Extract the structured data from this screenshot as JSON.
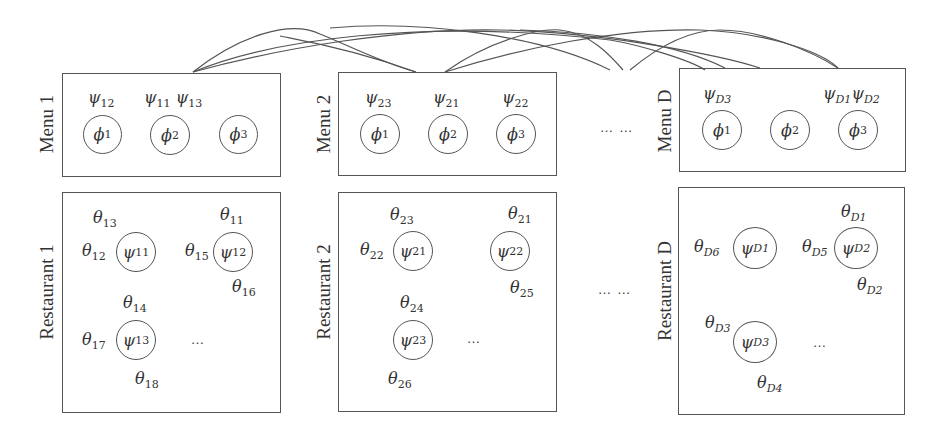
{
  "diagram": {
    "type": "menu-restaurant hierarchical model",
    "stroke_color": "#555555",
    "ellipsis": "… …",
    "inner_ellipsis": "…",
    "menus": [
      {
        "label": "Menu 1",
        "nodes": [
          {
            "sym": "ϕ",
            "sub": "1",
            "assigned": [
              {
                "sym": "ψ",
                "sub": "12"
              }
            ]
          },
          {
            "sym": "ϕ",
            "sub": "2",
            "assigned": [
              {
                "sym": "ψ",
                "sub": "11"
              },
              {
                "sym": "ψ",
                "sub": "13"
              }
            ]
          },
          {
            "sym": "ϕ",
            "sub": "3",
            "assigned": []
          }
        ]
      },
      {
        "label": "Menu 2",
        "nodes": [
          {
            "sym": "ϕ",
            "sub": "1",
            "assigned": [
              {
                "sym": "ψ",
                "sub": "23"
              }
            ]
          },
          {
            "sym": "ϕ",
            "sub": "2",
            "assigned": [
              {
                "sym": "ψ",
                "sub": "21"
              }
            ]
          },
          {
            "sym": "ϕ",
            "sub": "3",
            "assigned": [
              {
                "sym": "ψ",
                "sub": "22"
              }
            ]
          }
        ]
      },
      {
        "label": "Menu D",
        "nodes": [
          {
            "sym": "ϕ",
            "sub": "1",
            "assigned": [
              {
                "sym": "ψ",
                "sub": "D3"
              }
            ]
          },
          {
            "sym": "ϕ",
            "sub": "2",
            "assigned": []
          },
          {
            "sym": "ϕ",
            "sub": "3",
            "assigned": [
              {
                "sym": "ψ",
                "sub": "D1"
              },
              {
                "sym": "ψ",
                "sub": "D2"
              }
            ]
          }
        ]
      }
    ],
    "restaurants": [
      {
        "label": "Restaurant 1",
        "tables": [
          {
            "sym": "ψ",
            "sub": "11",
            "customers": [
              {
                "sym": "θ",
                "sub": "13"
              },
              {
                "sym": "θ",
                "sub": "12"
              }
            ]
          },
          {
            "sym": "ψ",
            "sub": "12",
            "customers": [
              {
                "sym": "θ",
                "sub": "11"
              },
              {
                "sym": "θ",
                "sub": "15"
              },
              {
                "sym": "θ",
                "sub": "16"
              }
            ]
          },
          {
            "sym": "ψ",
            "sub": "13",
            "customers": [
              {
                "sym": "θ",
                "sub": "14"
              },
              {
                "sym": "θ",
                "sub": "17"
              },
              {
                "sym": "θ",
                "sub": "18"
              }
            ]
          }
        ]
      },
      {
        "label": "Restaurant 2",
        "tables": [
          {
            "sym": "ψ",
            "sub": "21",
            "customers": [
              {
                "sym": "θ",
                "sub": "23"
              },
              {
                "sym": "θ",
                "sub": "22"
              }
            ]
          },
          {
            "sym": "ψ",
            "sub": "22",
            "customers": [
              {
                "sym": "θ",
                "sub": "21"
              },
              {
                "sym": "θ",
                "sub": "25"
              }
            ]
          },
          {
            "sym": "ψ",
            "sub": "23",
            "customers": [
              {
                "sym": "θ",
                "sub": "24"
              },
              {
                "sym": "θ",
                "sub": "26"
              }
            ]
          }
        ]
      },
      {
        "label": "Restaurant D",
        "tables": [
          {
            "sym": "ψ",
            "sub": "D1",
            "customers": [
              {
                "sym": "θ",
                "sub": "D6"
              }
            ]
          },
          {
            "sym": "ψ",
            "sub": "D2",
            "customers": [
              {
                "sym": "θ",
                "sub": "D1"
              },
              {
                "sym": "θ",
                "sub": "D5"
              },
              {
                "sym": "θ",
                "sub": "D2"
              }
            ]
          },
          {
            "sym": "ψ",
            "sub": "D3",
            "customers": [
              {
                "sym": "θ",
                "sub": "D3"
              },
              {
                "sym": "θ",
                "sub": "D4"
              }
            ]
          }
        ]
      }
    ]
  }
}
